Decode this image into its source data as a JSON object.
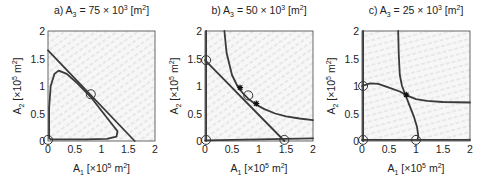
{
  "chart_data": [
    {
      "type": "line",
      "panel": "a",
      "title_prefix": "a)",
      "title_var": "A",
      "title_sub": "3",
      "title_eq": " = 75 × 10",
      "title_exp": "3",
      "title_unit": " [m",
      "title_unit_exp": "2",
      "title_close": "]",
      "xlabel_var": "A",
      "xlabel_sub": "1",
      "xlabel_unit": " [×10",
      "xlabel_exp": "5",
      "xlabel_m": " m",
      "xlabel_m_exp": "2",
      "xlabel_close": "]",
      "ylabel_var": "A",
      "ylabel_sub": "2",
      "ylabel_unit": " [×10",
      "ylabel_exp": "5",
      "ylabel_m": " m",
      "ylabel_m_exp": "2",
      "ylabel_close": "]",
      "xlim": [
        0,
        2
      ],
      "ylim": [
        0,
        2
      ],
      "xticks": [
        "0",
        "0.5",
        "1",
        "1.5",
        "2"
      ],
      "yticks": [
        "0",
        "0.5",
        "1",
        "1.5",
        "2"
      ],
      "grid": false,
      "vector_field": true,
      "series": [
        {
          "name": "nullcline-line",
          "x": [
            0,
            1.62
          ],
          "y": [
            1.65,
            0
          ]
        },
        {
          "name": "limit-cycle",
          "x": [
            0.02,
            0.02,
            0.05,
            0.12,
            0.2,
            0.35,
            0.55,
            0.8,
            1.0,
            1.2,
            1.3,
            1.28,
            1.1,
            0.7,
            0.3,
            0.05,
            0.02
          ],
          "y": [
            0.05,
            0.6,
            1.0,
            1.22,
            1.28,
            1.22,
            1.05,
            0.8,
            0.55,
            0.3,
            0.18,
            0.08,
            0.04,
            0.03,
            0.03,
            0.03,
            0.05
          ]
        }
      ],
      "equilibria": [
        {
          "x": 0.8,
          "y": 0.85,
          "type": "circle"
        },
        {
          "x": 0.0,
          "y": 0.02,
          "type": "circle"
        }
      ]
    },
    {
      "type": "line",
      "panel": "b",
      "title_prefix": "b)",
      "title_var": "A",
      "title_sub": "3",
      "title_eq": " = 50 × 10",
      "title_exp": "3",
      "title_unit": " [m",
      "title_unit_exp": "2",
      "title_close": "]",
      "xlabel_var": "A",
      "xlabel_sub": "1",
      "xlabel_unit": " [×10",
      "xlabel_exp": "5",
      "xlabel_m": " m",
      "xlabel_m_exp": "2",
      "xlabel_close": "]",
      "ylabel_var": "A",
      "ylabel_sub": "2",
      "ylabel_unit": " [×10",
      "ylabel_exp": "5",
      "ylabel_m": " m",
      "ylabel_m_exp": "2",
      "ylabel_close": "]",
      "xlim": [
        0,
        2
      ],
      "ylim": [
        0,
        2
      ],
      "xticks": [
        "0",
        "0.5",
        "1",
        "1.5",
        "2"
      ],
      "yticks": [
        "0",
        "0.5",
        "1",
        "1.5",
        "2"
      ],
      "grid": false,
      "vector_field": true,
      "series": [
        {
          "name": "nullcline-line",
          "x": [
            0,
            1.47
          ],
          "y": [
            1.47,
            0
          ]
        },
        {
          "name": "hyperbola",
          "x": [
            0.36,
            0.4,
            0.5,
            0.6,
            0.7,
            0.8,
            0.95,
            1.1,
            1.3,
            1.5,
            1.75,
            2.0
          ],
          "y": [
            2.0,
            1.6,
            1.2,
            1.0,
            0.87,
            0.77,
            0.66,
            0.58,
            0.5,
            0.45,
            0.41,
            0.38
          ]
        },
        {
          "name": "y-axis-line",
          "x": [
            0.02,
            0.02
          ],
          "y": [
            0,
            2
          ]
        },
        {
          "name": "x-axis-line",
          "x": [
            0,
            2
          ],
          "y": [
            0.01,
            0.05
          ]
        }
      ],
      "equilibria": [
        {
          "x": 0.02,
          "y": 1.47,
          "type": "circle"
        },
        {
          "x": 0.8,
          "y": 0.83,
          "type": "circle"
        },
        {
          "x": 0.02,
          "y": 0.02,
          "type": "circle"
        },
        {
          "x": 1.47,
          "y": 0.02,
          "type": "circle"
        },
        {
          "x": 0.65,
          "y": 0.97,
          "type": "star"
        },
        {
          "x": 0.95,
          "y": 0.68,
          "type": "star"
        }
      ]
    },
    {
      "type": "line",
      "panel": "c",
      "title_prefix": "c)",
      "title_var": "A",
      "title_sub": "3",
      "title_eq": " = 25 × 10",
      "title_exp": "3",
      "title_unit": " [m",
      "title_unit_exp": "2",
      "title_close": "]",
      "xlabel_var": "A",
      "xlabel_sub": "1",
      "xlabel_unit": " [×10",
      "xlabel_exp": "5",
      "xlabel_m": " m",
      "xlabel_m_exp": "2",
      "xlabel_close": "]",
      "ylabel_var": "A",
      "ylabel_sub": "2",
      "ylabel_unit": " [×10",
      "ylabel_exp": "5",
      "ylabel_m": " m",
      "ylabel_m_exp": "2",
      "ylabel_close": "]",
      "xlim": [
        0,
        2
      ],
      "ylim": [
        0,
        2
      ],
      "xticks": [
        "0",
        "0.5",
        "1",
        "1.5",
        "2"
      ],
      "yticks": [
        "0",
        "0.5",
        "1",
        "1.5",
        "2"
      ],
      "grid": false,
      "vector_field": true,
      "series": [
        {
          "name": "nullcline-vertical",
          "x": [
            0.67,
            0.68,
            0.7,
            0.74,
            0.8,
            0.88,
            0.96,
            1.02,
            1.04,
            1.03
          ],
          "y": [
            2.0,
            1.6,
            1.2,
            1.0,
            0.85,
            0.65,
            0.45,
            0.25,
            0.1,
            0.02
          ]
        },
        {
          "name": "nullcline-horizontal",
          "x": [
            0.0,
            0.15,
            0.3,
            0.5,
            0.7,
            0.85,
            1.0,
            1.2,
            1.5,
            2.0
          ],
          "y": [
            1.0,
            1.05,
            1.04,
            0.97,
            0.9,
            0.82,
            0.76,
            0.73,
            0.71,
            0.7
          ]
        },
        {
          "name": "y-axis-line",
          "x": [
            0.02,
            0.02
          ],
          "y": [
            0,
            2
          ]
        },
        {
          "name": "x-axis-line",
          "x": [
            0,
            2
          ],
          "y": [
            0.02,
            0.02
          ]
        }
      ],
      "equilibria": [
        {
          "x": 0.02,
          "y": 1.0,
          "type": "circle"
        },
        {
          "x": 0.02,
          "y": 0.02,
          "type": "circle"
        },
        {
          "x": 1.0,
          "y": 0.02,
          "type": "circle"
        },
        {
          "x": 0.82,
          "y": 0.84,
          "type": "star"
        }
      ]
    }
  ]
}
